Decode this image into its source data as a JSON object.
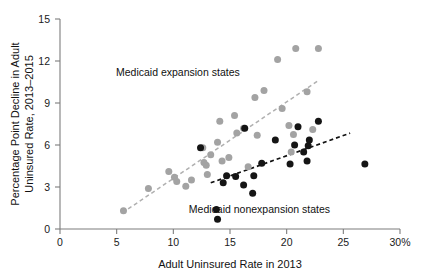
{
  "chart_data": {
    "type": "scatter",
    "title": "",
    "xlabel": "Adult Uninsured Rate in 2013",
    "ylabel": "Percentage Point Decline in Adult Uninsured Rate, 2013–2015",
    "ylabel_line1": "Percentage Point Decline in Adult",
    "ylabel_line2": "Uninsured Rate, 2013–2015",
    "xlim": [
      0,
      30
    ],
    "ylim": [
      0,
      15
    ],
    "xticks": [
      0,
      5,
      10,
      15,
      20,
      25,
      30
    ],
    "xtick_labels": [
      "0",
      "5",
      "10",
      "15",
      "20",
      "25",
      "30%"
    ],
    "yticks": [
      0,
      3,
      6,
      9,
      12,
      15
    ],
    "ytick_labels": [
      "0",
      "3",
      "6",
      "9",
      "12",
      "15"
    ],
    "grid": false,
    "legend_position": "inline-annotations",
    "annotations": [
      {
        "text": "Medicaid expansion states",
        "x": 10.4,
        "y": 11.2,
        "color": "#111111"
      },
      {
        "text": "Medicaid nonexpansion states",
        "x": 17.6,
        "y": 1.45,
        "color": "#111111"
      }
    ],
    "colors": {
      "expansion": "#a3a3a3",
      "nonexpansion": "#151515",
      "axis": "#7d7d7d",
      "background": "#ffffff"
    },
    "series": [
      {
        "name": "Medicaid expansion states",
        "marker": "circle",
        "color": "#a3a3a3",
        "points": [
          [
            5.6,
            1.3
          ],
          [
            7.8,
            2.9
          ],
          [
            9.6,
            4.1
          ],
          [
            10.1,
            3.7
          ],
          [
            10.3,
            3.4
          ],
          [
            11.1,
            3.05
          ],
          [
            11.6,
            3.5
          ],
          [
            12.6,
            5.8
          ],
          [
            12.7,
            4.75
          ],
          [
            12.9,
            4.55
          ],
          [
            13.0,
            3.9
          ],
          [
            13.3,
            5.3
          ],
          [
            13.9,
            6.2
          ],
          [
            14.1,
            7.7
          ],
          [
            14.3,
            4.85
          ],
          [
            14.9,
            5.1
          ],
          [
            15.4,
            8.1
          ],
          [
            15.6,
            6.85
          ],
          [
            16.2,
            7.2
          ],
          [
            16.6,
            4.45
          ],
          [
            17.2,
            9.4
          ],
          [
            17.4,
            6.7
          ],
          [
            18.0,
            9.9
          ],
          [
            19.2,
            12.1
          ],
          [
            19.6,
            8.6
          ],
          [
            20.2,
            7.4
          ],
          [
            20.4,
            5.5
          ],
          [
            20.6,
            6.75
          ],
          [
            20.8,
            12.9
          ],
          [
            21.8,
            9.8
          ],
          [
            22.3,
            7.1
          ],
          [
            22.8,
            12.9
          ]
        ]
      },
      {
        "name": "Medicaid nonexpansion states",
        "marker": "circle",
        "color": "#151515",
        "points": [
          [
            12.4,
            5.8
          ],
          [
            13.8,
            1.4
          ],
          [
            13.9,
            0.7
          ],
          [
            14.4,
            3.3
          ],
          [
            14.7,
            3.8
          ],
          [
            15.5,
            3.75
          ],
          [
            16.2,
            3.15
          ],
          [
            16.3,
            7.2
          ],
          [
            17.0,
            2.55
          ],
          [
            17.1,
            3.8
          ],
          [
            17.8,
            4.7
          ],
          [
            19.0,
            6.35
          ],
          [
            20.3,
            4.65
          ],
          [
            20.7,
            6.0
          ],
          [
            21.0,
            7.3
          ],
          [
            21.5,
            5.5
          ],
          [
            21.8,
            4.85
          ],
          [
            21.9,
            5.95
          ],
          [
            22.0,
            6.35
          ],
          [
            22.8,
            7.7
          ],
          [
            26.9,
            4.65
          ]
        ]
      }
    ],
    "trendlines": [
      {
        "name": "expansion-trend",
        "style": "dashed",
        "color": "#b0b0b0",
        "x0": 5.5,
        "y0": 1.15,
        "x1": 22.7,
        "y1": 10.55
      },
      {
        "name": "nonexpansion-trend",
        "style": "dashed",
        "color": "#121212",
        "x0": 13.3,
        "y0": 3.3,
        "x1": 25.6,
        "y1": 6.85
      }
    ]
  }
}
